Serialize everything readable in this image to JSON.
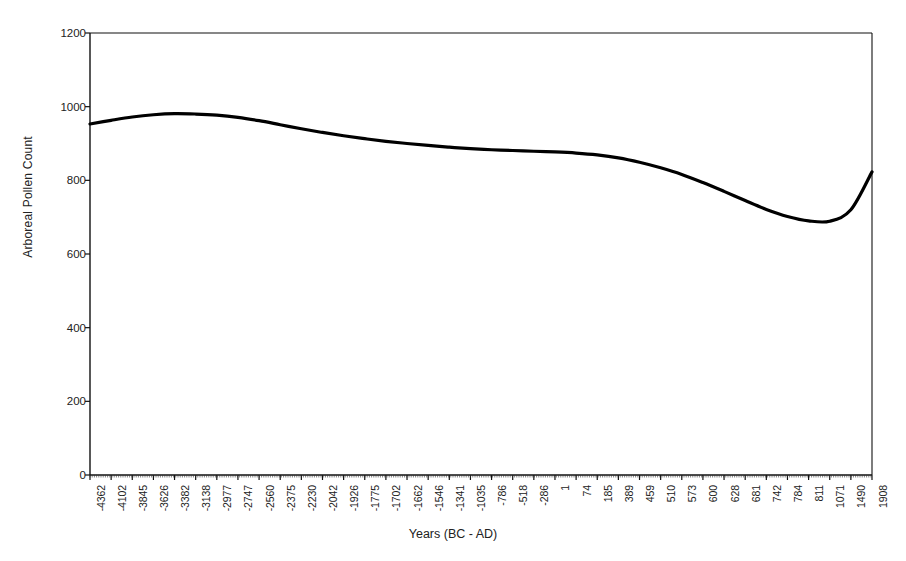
{
  "chart_data": {
    "type": "line",
    "title": "",
    "xlabel": "Years (BC - AD)",
    "ylabel": "Arboreal Pollen Count",
    "ylim": [
      0,
      1200
    ],
    "ytick_labels": [
      "1200",
      "1000",
      "800",
      "600",
      "400",
      "200",
      "0"
    ],
    "ytick_values": [
      1200,
      1000,
      800,
      600,
      400,
      200,
      0
    ],
    "grid": false,
    "legend": false,
    "categories": [
      "-4362",
      "-4102",
      "-3845",
      "-3626",
      "-3382",
      "-3138",
      "-2977",
      "-2747",
      "-2560",
      "-2375",
      "-2230",
      "-2042",
      "-1926",
      "-1775",
      "-1702",
      "-1662",
      "-1546",
      "-1341",
      "-1035",
      "-786",
      "-518",
      "-286",
      "1",
      "74",
      "185",
      "389",
      "459",
      "510",
      "573",
      "600",
      "628",
      "681",
      "742",
      "784",
      "811",
      "1071",
      "1490",
      "1908"
    ],
    "series": [
      {
        "name": "Arboreal Pollen Count",
        "color": "#000000",
        "values": [
          953,
          963,
          972,
          978,
          981,
          980,
          977,
          971,
          962,
          951,
          940,
          930,
          921,
          913,
          906,
          900,
          895,
          890,
          886,
          883,
          881,
          879,
          877,
          874,
          869,
          861,
          849,
          834,
          816,
          794,
          770,
          745,
          721,
          702,
          690,
          689,
          720,
          823
        ]
      }
    ]
  },
  "axes": {
    "y_axis_name": "y-axis",
    "x_axis_name": "x-axis"
  }
}
